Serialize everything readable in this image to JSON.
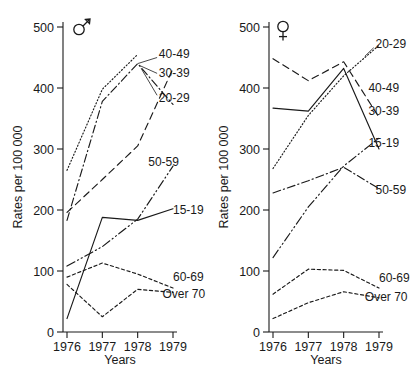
{
  "figure": {
    "panels": [
      {
        "id": "male",
        "sex_symbol": "male-symbol",
        "sex_label": "Male",
        "xlabel": "Years",
        "ylabel": "Rates per 100 000"
      },
      {
        "id": "female",
        "sex_symbol": "female-symbol",
        "sex_label": "Female",
        "xlabel": "Years",
        "ylabel": "Rates per 100 000"
      }
    ]
  },
  "axes": {
    "y_ticks": [
      "0",
      "100",
      "200",
      "300",
      "400",
      "500"
    ],
    "x_ticks": [
      "1976",
      "1977",
      "1978",
      "1979"
    ],
    "ylim": [
      0,
      500
    ],
    "xlim": [
      1976,
      1979
    ]
  },
  "chart_data": [
    {
      "type": "line",
      "title": "Male",
      "subtitle": "",
      "xlabel": "Years",
      "ylabel": "Rates per 100 000",
      "x": [
        1976,
        1977,
        1978,
        1979
      ],
      "xlim": [
        1976,
        1979
      ],
      "ylim": [
        0,
        500
      ],
      "grid": false,
      "legend_position": "inline-right-annotations",
      "series": [
        {
          "name": "40-49",
          "linestyle": "dotted",
          "values": [
            265,
            398,
            455,
            null
          ]
        },
        {
          "name": "30-39",
          "linestyle": "dashdot",
          "values": [
            183,
            378,
            440,
            373
          ]
        },
        {
          "name": "20-29",
          "linestyle": "dashed",
          "values": [
            196,
            250,
            305,
            432
          ]
        },
        {
          "name": "50-59",
          "linestyle": "dashdotdot",
          "values": [
            108,
            140,
            185,
            272
          ]
        },
        {
          "name": "15-19",
          "linestyle": "solid",
          "values": [
            22,
            188,
            183,
            202
          ]
        },
        {
          "name": "60-69",
          "linestyle": "smalldash",
          "values": [
            90,
            113,
            95,
            72
          ]
        },
        {
          "name": "Over 70",
          "linestyle": "smalldash",
          "values": [
            78,
            25,
            70,
            65
          ]
        }
      ],
      "annotations": [
        {
          "label": "40-49",
          "x": 1978.6,
          "y": 455
        },
        {
          "label": "30-39",
          "x": 1978.6,
          "y": 425
        },
        {
          "label": "20-29",
          "x": 1978.6,
          "y": 383
        },
        {
          "label": "50-59",
          "x": 1978.3,
          "y": 278
        },
        {
          "label": "15-19",
          "x": 1979.0,
          "y": 200
        },
        {
          "label": "60-69",
          "x": 1979.0,
          "y": 90
        },
        {
          "label": "Over 70",
          "x": 1978.7,
          "y": 62
        }
      ]
    },
    {
      "type": "line",
      "title": "Female",
      "subtitle": "",
      "xlabel": "Years",
      "ylabel": "Rates per 100 000",
      "x": [
        1976,
        1977,
        1978,
        1979
      ],
      "xlim": [
        1976,
        1979
      ],
      "ylim": [
        0,
        500
      ],
      "grid": false,
      "legend_position": "inline-right-annotations",
      "series": [
        {
          "name": "40-49",
          "linestyle": "dashed",
          "values": [
            448,
            412,
            443,
            352
          ]
        },
        {
          "name": "30-39",
          "linestyle": "solid",
          "values": [
            367,
            362,
            432,
            300
          ]
        },
        {
          "name": "20-29",
          "linestyle": "dotted",
          "values": [
            268,
            355,
            420,
            470
          ]
        },
        {
          "name": "50-59",
          "linestyle": "dashdot",
          "values": [
            228,
            248,
            270,
            235
          ]
        },
        {
          "name": "15-19",
          "linestyle": "dashdotdot",
          "values": [
            122,
            205,
            272,
            318
          ]
        },
        {
          "name": "60-69",
          "linestyle": "smalldash",
          "values": [
            62,
            103,
            101,
            72
          ]
        },
        {
          "name": "Over 70",
          "linestyle": "smalldash",
          "values": [
            22,
            48,
            66,
            56
          ]
        }
      ],
      "annotations": [
        {
          "label": "20-29",
          "x": 1978.9,
          "y": 472
        },
        {
          "label": "40-49",
          "x": 1978.7,
          "y": 400
        },
        {
          "label": "30-39",
          "x": 1978.7,
          "y": 362
        },
        {
          "label": "15-19",
          "x": 1978.7,
          "y": 310
        },
        {
          "label": "50-59",
          "x": 1978.9,
          "y": 232
        },
        {
          "label": "60-69",
          "x": 1979.0,
          "y": 88
        },
        {
          "label": "Over 70",
          "x": 1978.6,
          "y": 58
        }
      ]
    }
  ]
}
